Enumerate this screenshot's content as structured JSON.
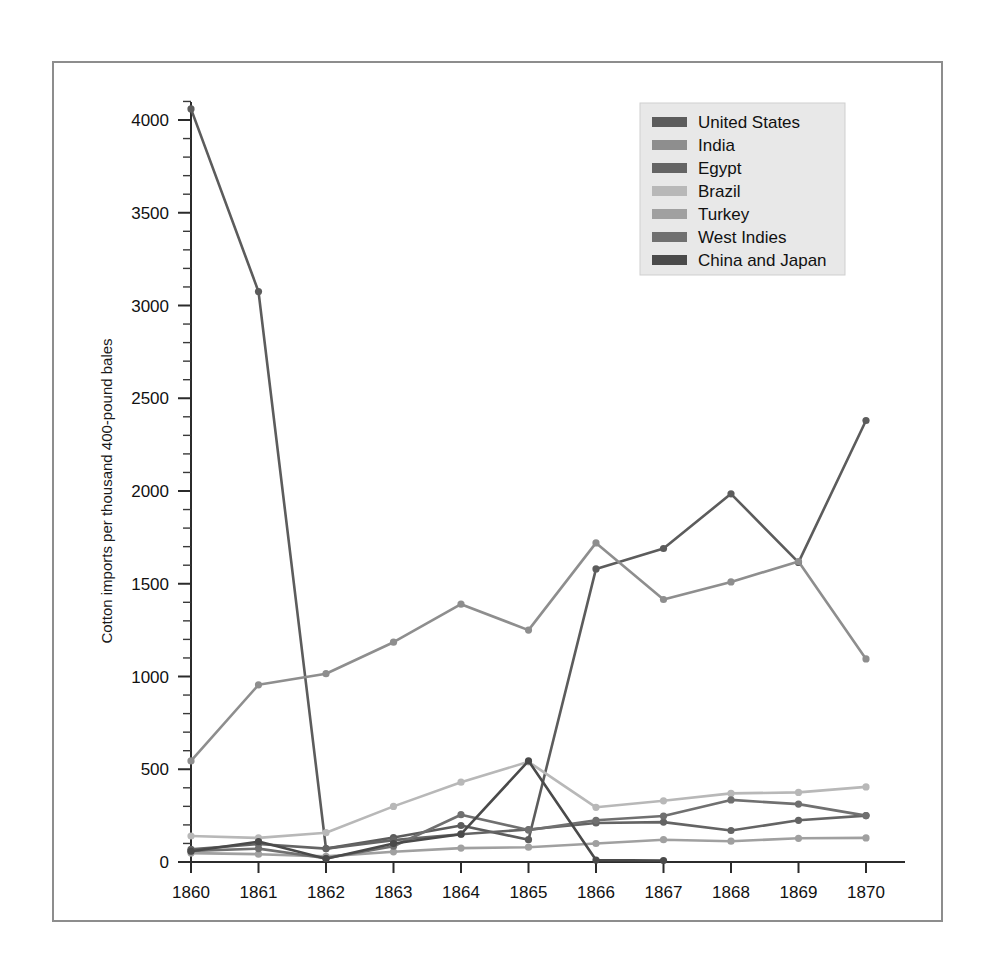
{
  "figure": {
    "frame_color": "#8d8d8d",
    "background": "#ffffff"
  },
  "chart_data": {
    "type": "line",
    "title": "",
    "xlabel": "",
    "ylabel": "Cotton imports per thousand 400-pound bales",
    "x": [
      1860,
      1861,
      1862,
      1863,
      1864,
      1865,
      1866,
      1867,
      1868,
      1869,
      1870
    ],
    "xtick_labels": [
      "1860",
      "1861",
      "1862",
      "1863",
      "1864",
      "1865",
      "1866",
      "1867",
      "1868",
      "1869",
      "1870"
    ],
    "ytick_labels": [
      "0",
      "500",
      "1000",
      "1500",
      "2000",
      "2500",
      "3000",
      "3500",
      "4000"
    ],
    "yticks": [
      0,
      500,
      1000,
      1500,
      2000,
      2500,
      3000,
      3500,
      4000
    ],
    "ylim": [
      0,
      4200
    ],
    "xlim": [
      1859.6,
      1870.4
    ],
    "minor_ticks": true,
    "grid": false,
    "legend_position": "upper center-right",
    "series": [
      {
        "name": "United States",
        "color": "#5c5c5c",
        "values": [
          4060,
          3075,
          72,
          132,
          197,
          120,
          1580,
          1690,
          1985,
          1615,
          2380
        ]
      },
      {
        "name": "India",
        "color": "#8e8e8e",
        "values": [
          545,
          955,
          1015,
          1185,
          1390,
          1250,
          1720,
          1415,
          1510,
          1620,
          1095
        ]
      },
      {
        "name": "Egypt",
        "color": "#646464",
        "values": [
          68,
          97,
          72,
          118,
          150,
          175,
          210,
          215,
          170,
          225,
          250
        ]
      },
      {
        "name": "Brazil",
        "color": "#b8b8b8",
        "values": [
          140,
          130,
          158,
          300,
          430,
          540,
          295,
          330,
          370,
          375,
          405
        ]
      },
      {
        "name": "Turkey",
        "color": "#a0a0a0",
        "values": [
          48,
          42,
          30,
          55,
          75,
          80,
          100,
          120,
          112,
          128,
          130
        ]
      },
      {
        "name": "West Indies",
        "color": "#707070",
        "values": [
          60,
          72,
          20,
          85,
          255,
          172,
          225,
          248,
          335,
          312,
          250
        ]
      },
      {
        "name": "China and Japan",
        "color": "#4a4a4a",
        "values": [
          58,
          110,
          18,
          100,
          150,
          545,
          10,
          8,
          null,
          null,
          null
        ]
      }
    ]
  },
  "legend": {
    "entries": [
      {
        "label": "United States",
        "color": "#5c5c5c"
      },
      {
        "label": "India",
        "color": "#8e8e8e"
      },
      {
        "label": "Egypt",
        "color": "#646464"
      },
      {
        "label": "Brazil",
        "color": "#b8b8b8"
      },
      {
        "label": "Turkey",
        "color": "#a0a0a0"
      },
      {
        "label": "West Indies",
        "color": "#707070"
      },
      {
        "label": "China and Japan",
        "color": "#4a4a4a"
      }
    ],
    "background": "#e8e8e8"
  }
}
